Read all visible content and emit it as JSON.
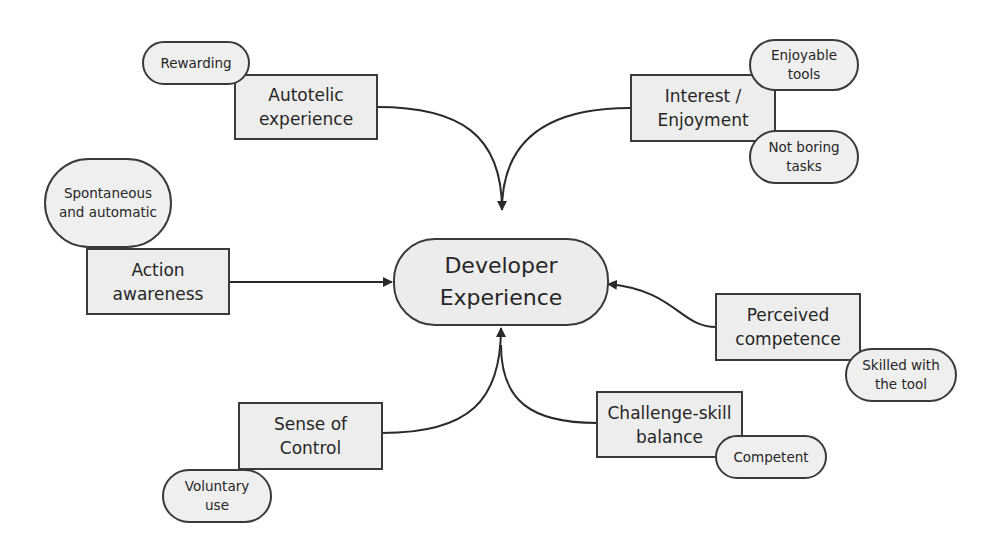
{
  "diagram": {
    "title": "Developer Experience",
    "center": {
      "id": "developer-experience",
      "lines": [
        "Developer",
        "Experience"
      ],
      "shape": "rounded-pill"
    },
    "factors": [
      {
        "id": "autotelic-experience",
        "lines": [
          "Autotelic",
          "experience"
        ],
        "tags": [
          {
            "id": "rewarding",
            "lines": [
              "Rewarding"
            ]
          }
        ]
      },
      {
        "id": "interest-enjoyment",
        "lines": [
          "Interest /",
          "Enjoyment"
        ],
        "tags": [
          {
            "id": "enjoyable-tools",
            "lines": [
              "Enjoyable",
              "tools"
            ]
          },
          {
            "id": "not-boring-tasks",
            "lines": [
              "Not boring",
              "tasks"
            ]
          }
        ]
      },
      {
        "id": "action-awareness",
        "lines": [
          "Action",
          "awareness"
        ],
        "tags": [
          {
            "id": "spontaneous-automatic",
            "lines": [
              "Spontaneous",
              "and automatic"
            ]
          }
        ]
      },
      {
        "id": "perceived-competence",
        "lines": [
          "Perceived",
          "competence"
        ],
        "tags": [
          {
            "id": "skilled-with-tool",
            "lines": [
              "Skilled with",
              "the tool"
            ]
          }
        ]
      },
      {
        "id": "sense-of-control",
        "lines": [
          "Sense of",
          "Control"
        ],
        "tags": [
          {
            "id": "voluntary-use",
            "lines": [
              "Voluntary",
              "use"
            ]
          }
        ]
      },
      {
        "id": "challenge-skill-balance",
        "lines": [
          "Challenge-skill",
          "balance"
        ],
        "tags": [
          {
            "id": "competent",
            "lines": [
              "Competent"
            ]
          }
        ]
      }
    ],
    "edges": [
      {
        "from": "autotelic-experience",
        "to": "developer-experience",
        "style": "curved-arrow"
      },
      {
        "from": "interest-enjoyment",
        "to": "developer-experience",
        "style": "curved-arrow"
      },
      {
        "from": "action-awareness",
        "to": "developer-experience",
        "style": "straight-arrow"
      },
      {
        "from": "perceived-competence",
        "to": "developer-experience",
        "style": "curved-arrow"
      },
      {
        "from": "sense-of-control",
        "to": "developer-experience",
        "style": "curved-arrow"
      },
      {
        "from": "challenge-skill-balance",
        "to": "developer-experience",
        "style": "curved-arrow"
      }
    ],
    "colors": {
      "node_fill": "#ededed",
      "stroke": "#3a3a3a",
      "text": "#262626",
      "background": "#ffffff"
    }
  }
}
